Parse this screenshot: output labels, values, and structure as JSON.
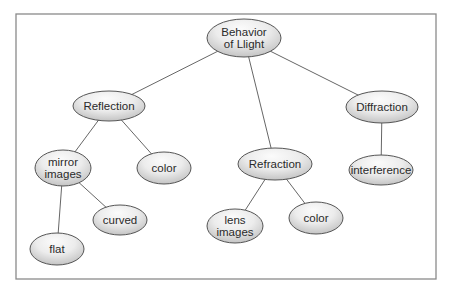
{
  "diagram": {
    "type": "concept-map",
    "colors": {
      "frame": "#8a8a8a",
      "edge": "#555555",
      "node_fill_light": "#fbfbfb",
      "node_fill_dark": "#c4c4c4",
      "node_stroke": "#555555",
      "text": "#2a2a2a"
    },
    "nodes": [
      {
        "id": "root",
        "lines": [
          "Behavior",
          "of Llight"
        ],
        "cx": 244,
        "cy": 38,
        "rx": 37,
        "ry": 19
      },
      {
        "id": "reflection",
        "lines": [
          "Reflection"
        ],
        "cx": 109,
        "cy": 106,
        "rx": 36,
        "ry": 15
      },
      {
        "id": "mirror",
        "lines": [
          "mirror",
          "images"
        ],
        "cx": 63,
        "cy": 168,
        "rx": 28,
        "ry": 18
      },
      {
        "id": "refl-color",
        "lines": [
          "color"
        ],
        "cx": 164,
        "cy": 168,
        "rx": 27,
        "ry": 16
      },
      {
        "id": "curved",
        "lines": [
          "curved"
        ],
        "cx": 120,
        "cy": 220,
        "rx": 27,
        "ry": 15
      },
      {
        "id": "flat",
        "lines": [
          "flat"
        ],
        "cx": 57,
        "cy": 249,
        "rx": 27,
        "ry": 16
      },
      {
        "id": "refraction",
        "lines": [
          "Refraction"
        ],
        "cx": 275,
        "cy": 164,
        "rx": 37,
        "ry": 16
      },
      {
        "id": "lens",
        "lines": [
          "lens",
          "images"
        ],
        "cx": 235,
        "cy": 226,
        "rx": 28,
        "ry": 17
      },
      {
        "id": "refr-color",
        "lines": [
          "color"
        ],
        "cx": 316,
        "cy": 218,
        "rx": 27,
        "ry": 16
      },
      {
        "id": "diffraction",
        "lines": [
          "Diffraction"
        ],
        "cx": 382,
        "cy": 107,
        "rx": 36,
        "ry": 16
      },
      {
        "id": "interference",
        "lines": [
          "interference"
        ],
        "cx": 381,
        "cy": 170,
        "rx": 32,
        "ry": 15
      }
    ],
    "edges": [
      [
        "root",
        "reflection"
      ],
      [
        "root",
        "refraction"
      ],
      [
        "root",
        "diffraction"
      ],
      [
        "reflection",
        "mirror"
      ],
      [
        "reflection",
        "refl-color"
      ],
      [
        "mirror",
        "curved"
      ],
      [
        "mirror",
        "flat"
      ],
      [
        "refraction",
        "lens"
      ],
      [
        "refraction",
        "refr-color"
      ],
      [
        "diffraction",
        "interference"
      ]
    ],
    "frame": {
      "x": 16,
      "y": 14,
      "width": 420,
      "height": 265
    }
  }
}
